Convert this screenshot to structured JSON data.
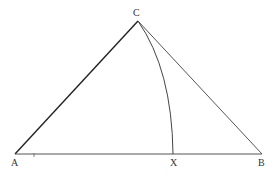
{
  "diagram": {
    "type": "geometry-construction",
    "points": {
      "A": {
        "label": "A",
        "x": 15,
        "y": 154
      },
      "B": {
        "label": "B",
        "x": 262,
        "y": 154
      },
      "C": {
        "label": "C",
        "x": 138,
        "y": 21
      },
      "X": {
        "label": "X",
        "x": 173,
        "y": 154
      }
    },
    "segments": [
      {
        "from": "A",
        "to": "C"
      },
      {
        "from": "C",
        "to": "B"
      },
      {
        "from": "A",
        "to": "B"
      }
    ],
    "arcs": [
      {
        "from": "C",
        "to": "X",
        "description": "arc from C to X on AB"
      }
    ],
    "colors": {
      "line": "#333333",
      "line_light": "#666666",
      "background": "#ffffff"
    }
  }
}
